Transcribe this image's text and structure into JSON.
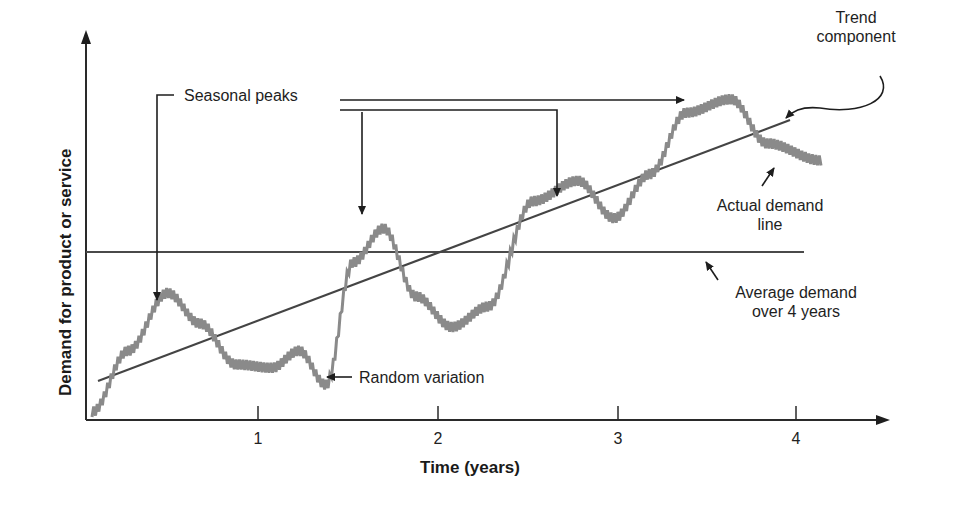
{
  "chart_data": {
    "type": "line",
    "title": "",
    "xlabel": "Time (years)",
    "ylabel": "Demand for product or service",
    "x_ticks": [
      "1",
      "2",
      "3",
      "4"
    ],
    "xlim": [
      0,
      4.3
    ],
    "grid": false,
    "legend": null,
    "series": [
      {
        "name": "Actual demand line",
        "style": "jagged gray line",
        "x": [
          0.0,
          0.2,
          0.42,
          0.6,
          0.8,
          1.0,
          1.15,
          1.3,
          1.45,
          1.62,
          1.8,
          2.0,
          2.2,
          2.45,
          2.7,
          2.9,
          3.1,
          3.3,
          3.55,
          3.75,
          4.05
        ],
        "y": [
          0.0,
          0.9,
          1.75,
          1.3,
          0.7,
          0.65,
          0.9,
          0.4,
          2.2,
          2.7,
          1.7,
          1.25,
          1.55,
          3.1,
          3.4,
          2.85,
          3.5,
          4.4,
          4.6,
          3.95,
          3.7
        ]
      },
      {
        "name": "Trend component",
        "style": "straight dark line",
        "x": [
          0.05,
          3.95
        ],
        "y": [
          0.45,
          4.15
        ]
      },
      {
        "name": "Average demand over 4 years",
        "style": "horizontal dark line",
        "x": [
          0.0,
          4.3
        ],
        "y": [
          2.35,
          2.35
        ]
      }
    ],
    "annotations": [
      "Seasonal peaks",
      "Trend component",
      "Actual demand line",
      "Average demand over 4 years",
      "Random variation"
    ]
  },
  "labels": {
    "seasonal_peaks": "Seasonal peaks",
    "trend_line1": "Trend",
    "trend_line2": "component",
    "actual_line1": "Actual demand",
    "actual_line2": "line",
    "average_line1": "Average demand",
    "average_line2": "over 4 years",
    "random_variation": "Random variation"
  },
  "axes": {
    "x_label": "Time (years)",
    "y_label": "Demand for product or service",
    "ticks": [
      "1",
      "2",
      "3",
      "4"
    ]
  },
  "colors": {
    "axis": "#2a2a2a",
    "trend_line": "#444444",
    "average_line": "#4a4a4a",
    "actual_line": "#8a8a8a",
    "text": "#1e1e1e"
  }
}
